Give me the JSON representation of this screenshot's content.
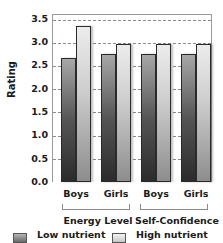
{
  "chart_data": {
    "type": "bar",
    "title": "",
    "xlabel": "",
    "ylabel": "Rating",
    "ylim": [
      0,
      3.5
    ],
    "yticks": [
      "0.0",
      "0.5",
      "1.0",
      "1.5",
      "2.0",
      "2.5",
      "3.0",
      "3.5"
    ],
    "categories": [
      "Boys",
      "Girls",
      "Boys",
      "Girls"
    ],
    "groups": [
      {
        "label": "Energy Level",
        "categories": [
          "Boys",
          "Girls"
        ]
      },
      {
        "label": "Self-Confidence",
        "categories": [
          "Boys",
          "Girls"
        ]
      }
    ],
    "series": [
      {
        "name": "Low nutrient",
        "color": "#4a4a4a",
        "values": [
          2.65,
          2.75,
          2.75,
          2.75
        ]
      },
      {
        "name": "High nutrient",
        "color": "#dcdcdc",
        "values": [
          3.35,
          2.95,
          2.95,
          2.95
        ]
      }
    ],
    "grid": true,
    "legend_position": "bottom"
  },
  "legend": {
    "low": "Low nutrient",
    "high": "High nutrient"
  }
}
